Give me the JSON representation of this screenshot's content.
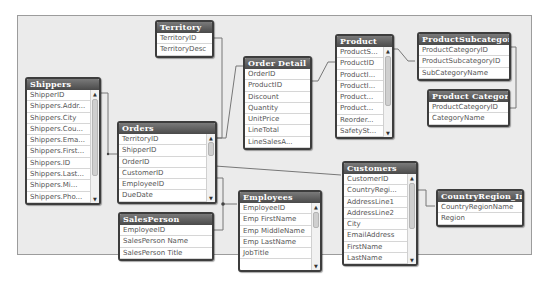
{
  "diagram": {
    "type": "table relationship diagram",
    "tables": [
      {
        "id": "territory",
        "title": "Territory",
        "fields": [
          "TerritoryID",
          "TerritoryDesc"
        ]
      },
      {
        "id": "shippers",
        "title": "Shippers",
        "fields": [
          "ShipperID",
          "Shippers.Addr...",
          "Shippers.City",
          "Shippers.Cou...",
          "Shippers.Ema...",
          "Shippers.First...",
          "Shippers.ID",
          "Shippers.Last...",
          "Shippers.Mi...",
          "Shippers.Pho..."
        ]
      },
      {
        "id": "orders",
        "title": "Orders",
        "fields": [
          "TerritoryID",
          "ShipperID",
          "OrderID",
          "CustomerID",
          "EmployeeID",
          "DueDate"
        ]
      },
      {
        "id": "order_detail",
        "title": "Order Detail",
        "fields": [
          "OrderID",
          "ProductID",
          "Discount",
          "Quantity",
          "UnitPrice",
          "LineTotal",
          "LineSalesA..."
        ]
      },
      {
        "id": "product",
        "title": "Product",
        "fields": [
          "ProductS...",
          "ProductID",
          "ProductI...",
          "ProductI...",
          "Product...",
          "Product...",
          "Reorder...",
          "SafetySt..."
        ]
      },
      {
        "id": "product_subcategory",
        "title": "ProductSubcategory",
        "fields": [
          "ProductCategoryID",
          "ProductSubcategoryID",
          "SubCategoryName"
        ]
      },
      {
        "id": "product_category",
        "title": "Product Category",
        "fields": [
          "ProductCategoryID",
          "CategoryName"
        ]
      },
      {
        "id": "customers",
        "title": "Customers",
        "fields": [
          "CustomerID",
          "CountryRegi...",
          "AddressLine1",
          "AddressLine2",
          "City",
          "EmailAddress",
          "FirstName",
          "LastName"
        ]
      },
      {
        "id": "country_region",
        "title": "CountryRegion_Inline",
        "fields": [
          "CountryRegionName",
          "Region"
        ]
      },
      {
        "id": "employees",
        "title": "Employees",
        "fields": [
          "EmployeeID",
          "Emp FirstName",
          "Emp MiddleName",
          "Emp LastName",
          "JobTitle"
        ]
      },
      {
        "id": "salesperson",
        "title": "SalesPerson",
        "fields": [
          "EmployeeID",
          "SalesPerson Name",
          "SalesPerson Title"
        ]
      }
    ],
    "relationships": [
      {
        "from": "Territory.TerritoryID",
        "to": "Orders.TerritoryID"
      },
      {
        "from": "Shippers.ShipperID",
        "to": "Orders.ShipperID"
      },
      {
        "from": "Orders.OrderID",
        "to": "Order Detail.OrderID"
      },
      {
        "from": "Order Detail.ProductID",
        "to": "Product.ProductID"
      },
      {
        "from": "Product.ProductSubcategoryID",
        "to": "ProductSubcategory.ProductSubcategoryID"
      },
      {
        "from": "ProductSubcategory.ProductCategoryID",
        "to": "Product Category.ProductCategoryID"
      },
      {
        "from": "Orders.CustomerID",
        "to": "Customers.CustomerID"
      },
      {
        "from": "Customers.CountryRegionName",
        "to": "CountryRegion_Inline.CountryRegionName"
      },
      {
        "from": "Orders.EmployeeID",
        "to": "Employees.EmployeeID"
      },
      {
        "from": "SalesPerson.EmployeeID",
        "to": "Employees.EmployeeID"
      }
    ]
  }
}
